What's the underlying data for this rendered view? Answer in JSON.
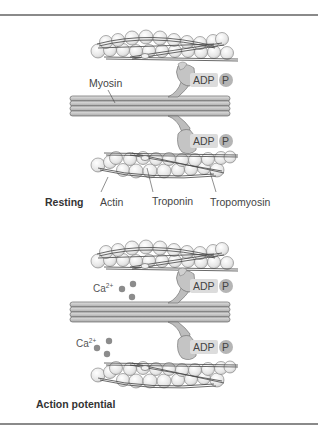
{
  "figure": {
    "panels": [
      {
        "id": "resting",
        "title": "Resting",
        "labels": {
          "myosin": "Myosin",
          "adp_top": "ADP",
          "p_top": "P",
          "adp_bottom": "ADP",
          "p_bottom": "P",
          "actin": "Actin",
          "troponin": "Troponin",
          "tropomyosin": "Tropomyosin"
        }
      },
      {
        "id": "action-potential",
        "title": "Action potential",
        "labels": {
          "calcium_top": "Ca",
          "calcium_top_charge": "2+",
          "calcium_bottom": "Ca",
          "calcium_bottom_charge": "2+",
          "adp_top": "ADP",
          "p_top": "P",
          "adp_bottom": "ADP",
          "p_bottom": "P"
        }
      }
    ],
    "colors": {
      "rule": "#8a8a8a",
      "actin_fill": "#e9e9e9",
      "myosin_fill": "#c9c9c9",
      "head_fill": "#bdbdbd",
      "adp_bg": "#dcdcdc",
      "p_circle": "#b5b5b5",
      "calcium": "#8c8c8c"
    }
  }
}
